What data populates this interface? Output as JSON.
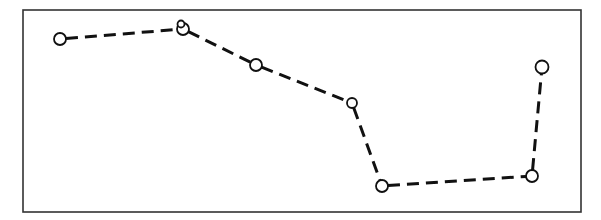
{
  "chart_data": {
    "type": "line",
    "title": "",
    "xlabel": "",
    "ylabel": "",
    "grid": false,
    "legend": null,
    "axes_ticks": false,
    "line_style": "dashed",
    "marker": "open-circle",
    "frame": {
      "x1": 23,
      "y1": 10,
      "x2": 581,
      "y2": 212
    },
    "points_px": [
      {
        "x": 60,
        "y": 39,
        "r": 6
      },
      {
        "x": 183,
        "y": 29,
        "r": 6
      },
      {
        "x": 256,
        "y": 65,
        "r": 6
      },
      {
        "x": 352,
        "y": 103,
        "r": 5
      },
      {
        "x": 382,
        "y": 186,
        "r": 6
      },
      {
        "x": 532,
        "y": 176,
        "r": 6
      },
      {
        "x": 542,
        "y": 67,
        "r": 6.5
      }
    ],
    "extra_markers_px": [
      {
        "x": 181,
        "y": 24,
        "r": 3.5
      }
    ],
    "relative_values": [
      0.86,
      0.91,
      0.73,
      0.54,
      0.13,
      0.18,
      0.72
    ],
    "colors": {
      "line": "#111111",
      "frame": "#333333",
      "marker_fill": "#ffffff",
      "background": "#ffffff"
    }
  }
}
